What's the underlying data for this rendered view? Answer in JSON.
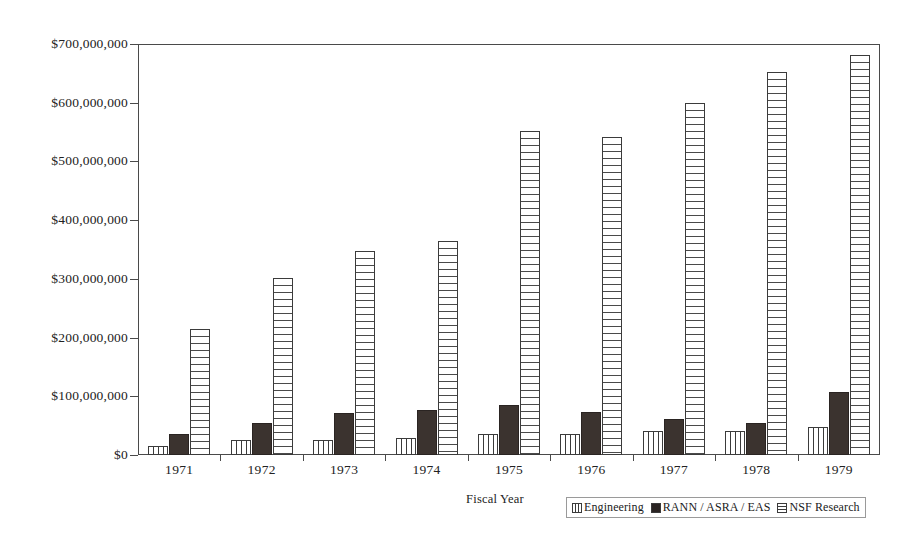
{
  "chart_data": {
    "type": "bar",
    "title": "",
    "subtitle": "",
    "xlabel": "Fiscal Year",
    "ylabel": "",
    "grid": false,
    "legend_position": "bottom-right",
    "categories": [
      "1971",
      "1972",
      "1973",
      "1974",
      "1975",
      "1976",
      "1977",
      "1978",
      "1979"
    ],
    "ylim": [
      0,
      700000000
    ],
    "ytick_labels": [
      "$0",
      "$100,000,000",
      "$200,000,000",
      "$300,000,000",
      "$400,000,000",
      "$500,000,000",
      "$600,000,000",
      "$700,000,000"
    ],
    "ytick_values": [
      0,
      100000000,
      200000000,
      300000000,
      400000000,
      500000000,
      600000000,
      700000000
    ],
    "series": [
      {
        "name": "Engineering",
        "pattern": "vertical-stripes",
        "color": "#ffffff",
        "values": [
          15000000,
          26000000,
          26000000,
          29000000,
          36000000,
          36000000,
          41000000,
          41000000,
          47000000
        ]
      },
      {
        "name": "RANN / ASRA / EAS",
        "pattern": "solid",
        "color": "#3b332f",
        "values": [
          35000000,
          55000000,
          71000000,
          77000000,
          85000000,
          73000000,
          62000000,
          55000000,
          108000000
        ]
      },
      {
        "name": "NSF Research",
        "pattern": "horizontal-stripes",
        "color": "#ffffff",
        "values": [
          214000000,
          302000000,
          347000000,
          365000000,
          551000000,
          542000000,
          599000000,
          653000000,
          682000000
        ]
      }
    ]
  }
}
